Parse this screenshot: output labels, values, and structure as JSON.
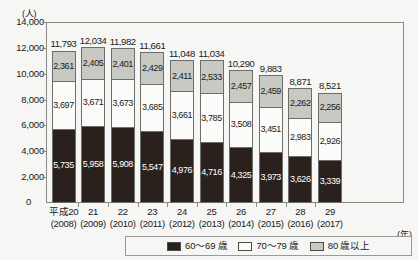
{
  "unit_label": "(人)",
  "x_unit_label": "(年)",
  "zero_label": "0",
  "title_faint": "",
  "legend": {
    "items": [
      {
        "label": "60〜69 歳",
        "color": "#2a211d",
        "key": "age_60_69"
      },
      {
        "label": "70〜79 歳",
        "color": "#fbfbf9",
        "key": "age_70_79"
      },
      {
        "label": "80 歳以上",
        "color": "#c9c9c4",
        "key": "age_80_plus"
      }
    ]
  },
  "chart_data": {
    "type": "bar",
    "stacked": true,
    "title": "",
    "xlabel": "(年)",
    "ylabel": "(人)",
    "ylim": [
      0,
      14000
    ],
    "ytick_step": 2000,
    "yticks": [
      0,
      2000,
      4000,
      6000,
      8000,
      10000,
      12000,
      14000
    ],
    "ytick_labels": [
      "0",
      "2,000",
      "4,000",
      "6,000",
      "8,000",
      "10,000",
      "12,000",
      "14,000"
    ],
    "grid": false,
    "legend_position": "bottom",
    "categories": [
      "平成20",
      "21",
      "22",
      "23",
      "24",
      "25",
      "26",
      "27",
      "28",
      "29"
    ],
    "category_sublabels": [
      "(2008)",
      "(2009)",
      "(2010)",
      "(2011)",
      "(2012)",
      "(2013)",
      "(2014)",
      "(2015)",
      "(2016)",
      "(2017)"
    ],
    "series": [
      {
        "name": "60〜69 歳",
        "color": "#2a211d",
        "values": [
          5735,
          5958,
          5908,
          5547,
          4976,
          4716,
          4325,
          3973,
          3626,
          3339
        ],
        "labels": [
          "5,735",
          "5,958",
          "5,908",
          "5,547",
          "4,976",
          "4,716",
          "4,325",
          "3,973",
          "3,626",
          "3,339"
        ]
      },
      {
        "name": "70〜79 歳",
        "color": "#fbfbf9",
        "values": [
          3697,
          3671,
          3673,
          3685,
          3661,
          3785,
          3508,
          3451,
          2983,
          2926
        ],
        "labels": [
          "3,697",
          "3,671",
          "3,673",
          "3,685",
          "3,661",
          "3,785",
          "3,508",
          "3,451",
          "2,983",
          "2,926"
        ]
      },
      {
        "name": "80 歳以上",
        "color": "#c9c9c4",
        "values": [
          2361,
          2405,
          2401,
          2429,
          2411,
          2533,
          2457,
          2459,
          2262,
          2256
        ],
        "labels": [
          "2,361",
          "2,405",
          "2,401",
          "2,429",
          "2,411",
          "2,533",
          "2,457",
          "2,459",
          "2,262",
          "2,256"
        ]
      }
    ],
    "totals": [
      11793,
      12034,
      11982,
      11661,
      11048,
      11034,
      10290,
      9883,
      8871,
      8521
    ],
    "total_labels": [
      "11,793",
      "12,034",
      "11,982",
      "11,661",
      "11,048",
      "11,034",
      "10,290",
      "9,883",
      "8,871",
      "8,521"
    ]
  }
}
